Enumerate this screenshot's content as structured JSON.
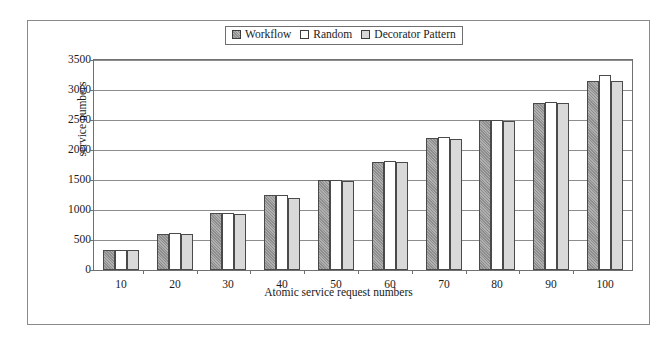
{
  "chart_data": {
    "type": "bar",
    "title": "",
    "xlabel": "Atomic service request numbers",
    "ylabel": "service numbers",
    "categories": [
      "10",
      "20",
      "30",
      "40",
      "50",
      "60",
      "70",
      "80",
      "90",
      "100"
    ],
    "series": [
      {
        "name": "Workflow",
        "values": [
          330,
          600,
          950,
          1250,
          1500,
          1800,
          2200,
          2500,
          2780,
          3150
        ]
      },
      {
        "name": "Random",
        "values": [
          340,
          610,
          950,
          1250,
          1500,
          1820,
          2210,
          2500,
          2800,
          3250
        ]
      },
      {
        "name": "Decorator Pattern",
        "values": [
          330,
          600,
          940,
          1200,
          1480,
          1800,
          2180,
          2480,
          2780,
          3150
        ]
      }
    ],
    "ylim": [
      0,
      3500
    ],
    "yticks": [
      0,
      500,
      1000,
      1500,
      2000,
      2500,
      3000,
      3500
    ],
    "ytick_labels": [
      "0",
      "500",
      "1000",
      "1500",
      "2000",
      "2500",
      "3000",
      "3500"
    ],
    "grid": true,
    "legend_position": "top-center"
  },
  "legend": {
    "entries": [
      {
        "label": "Workflow",
        "swatch": "swatch-workflow-icon",
        "color": "#9a9a9a"
      },
      {
        "label": "Random",
        "swatch": "swatch-random-icon",
        "color": "#ffffff"
      },
      {
        "label": "Decorator Pattern",
        "swatch": "swatch-decorator-icon",
        "color": "#d8d8d8"
      }
    ]
  },
  "axes": {
    "y_title": "service numbers",
    "x_title": "Atomic service request numbers"
  }
}
